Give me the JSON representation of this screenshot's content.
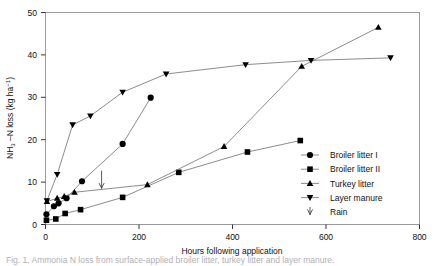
{
  "figure": {
    "caption_partial": "Fig. 1. Ammonia N loss from surface-applied broiler litter, turkey litter and layer manure."
  },
  "chart_data": {
    "type": "line",
    "title": "",
    "xlabel": "Hours following application",
    "ylabel": "NH3 –N loss (kg ha−1)",
    "ylabel_parts": {
      "base1": "NH",
      "sub": "3",
      "base2": " –N loss (kg ha",
      "sup": "−1",
      "base3": ")"
    },
    "xlim": [
      0,
      800
    ],
    "ylim": [
      0,
      50
    ],
    "xticks": [
      0,
      200,
      400,
      600,
      800
    ],
    "yticks": [
      0,
      10,
      20,
      30,
      40,
      50
    ],
    "xtick_labels": [
      "0",
      "200",
      "400",
      "600",
      "800"
    ],
    "ytick_labels": [
      "0",
      "10",
      "20",
      "30",
      "40",
      "50"
    ],
    "grid": false,
    "legend_position": "right-inside",
    "series": [
      {
        "name": "Broiler litter I",
        "marker": "circle",
        "color": "#000000",
        "points": [
          [
            2,
            2.4
          ],
          [
            18,
            4.3
          ],
          [
            28,
            5.0
          ],
          [
            45,
            6.2
          ],
          [
            78,
            10.2
          ],
          [
            165,
            19.0
          ],
          [
            225,
            29.9
          ]
        ]
      },
      {
        "name": "Broiler litter II",
        "marker": "square",
        "color": "#000000",
        "points": [
          [
            2,
            1.0
          ],
          [
            22,
            1.3
          ],
          [
            42,
            2.6
          ],
          [
            75,
            3.5
          ],
          [
            165,
            6.4
          ],
          [
            285,
            12.3
          ],
          [
            432,
            17.1
          ],
          [
            545,
            19.8
          ]
        ]
      },
      {
        "name": "Turkey litter",
        "marker": "triangle-up",
        "color": "#000000",
        "points": [
          [
            3,
            5.4
          ],
          [
            25,
            6.2
          ],
          [
            40,
            6.6
          ],
          [
            62,
            7.6
          ],
          [
            218,
            9.4
          ],
          [
            382,
            18.4
          ],
          [
            548,
            37.3
          ],
          [
            712,
            46.5
          ]
        ]
      },
      {
        "name": "Layer manure",
        "marker": "triangle-down",
        "color": "#000000",
        "points": [
          [
            3,
            5.6
          ],
          [
            25,
            11.8
          ],
          [
            58,
            23.5
          ],
          [
            96,
            25.6
          ],
          [
            165,
            31.2
          ],
          [
            258,
            35.5
          ],
          [
            428,
            37.7
          ],
          [
            568,
            38.7
          ],
          [
            738,
            39.3
          ]
        ]
      }
    ],
    "annotations": [
      {
        "name": "Rain",
        "marker": "rain-arrow",
        "x": 120,
        "y_top": 12.6,
        "y_bottom": 8.6
      }
    ],
    "legend_entries": [
      {
        "label": "Broiler litter I",
        "marker": "circle"
      },
      {
        "label": "Broiler litter II",
        "marker": "square"
      },
      {
        "label": "Turkey litter",
        "marker": "triangle-up"
      },
      {
        "label": "Layer manure",
        "marker": "triangle-down"
      },
      {
        "label": "Rain",
        "marker": "rain-arrow"
      }
    ]
  }
}
